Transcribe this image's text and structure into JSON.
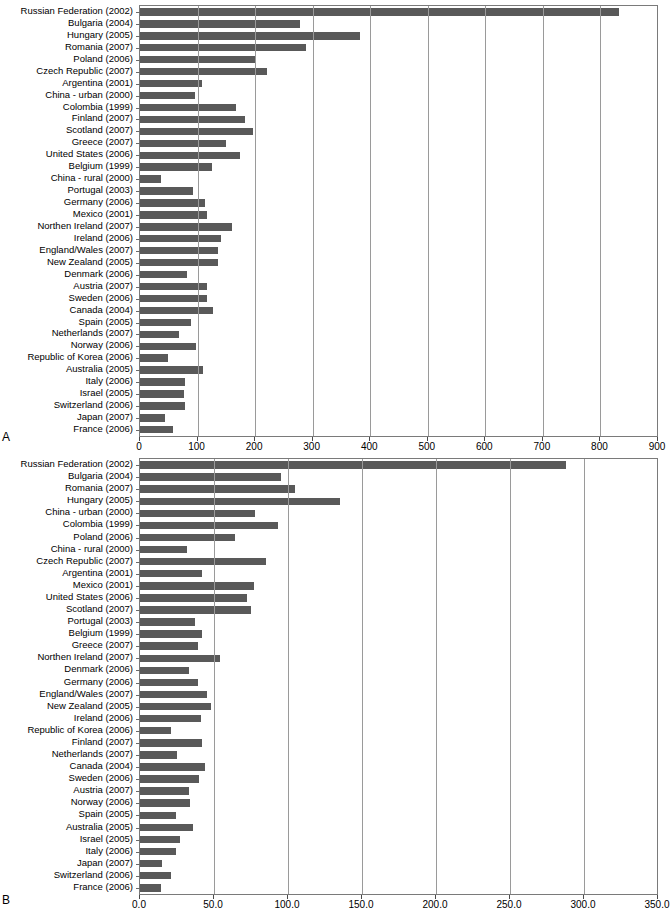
{
  "figure": {
    "panel_a_letter": "A",
    "panel_b_letter": "B",
    "bar_color": "#595959",
    "axis_color": "#7a7a7a",
    "gridline_color": "#9a9a9a",
    "background": "#ffffff"
  },
  "chart_data": [
    {
      "id": "panel-a",
      "type": "bar",
      "orientation": "horizontal",
      "title": "",
      "subtitle": "",
      "xlabel": "",
      "ylabel": "",
      "xlim": [
        0,
        900
      ],
      "xticks": [
        0,
        100,
        200,
        300,
        400,
        500,
        600,
        700,
        800,
        900
      ],
      "xtick_labels": [
        "0",
        "100",
        "200",
        "300",
        "400",
        "500",
        "600",
        "700",
        "800",
        "900"
      ],
      "grid": true,
      "grid_axis": "x",
      "legend": "none",
      "panel_label": "A",
      "categories": [
        "Russian Federation (2002)",
        "Bulgaria (2004)",
        "Hungary (2005)",
        "Romania (2007)",
        "Poland (2006)",
        "Czech Republic (2007)",
        "Argentina (2001)",
        "China - urban (2000)",
        "Colombia (1999)",
        "Finland (2007)",
        "Scotland (2007)",
        "Greece (2007)",
        "United States (2006)",
        "Belgium (1999)",
        "China - rural (2000)",
        "Portugal (2003)",
        "Germany (2006)",
        "Mexico (2001)",
        "Northen Ireland (2007)",
        "Ireland (2006)",
        "England/Wales (2007)",
        "New Zealand (2005)",
        "Denmark (2006)",
        "Austria (2007)",
        "Sweden (2006)",
        "Canada (2004)",
        "Spain (2005)",
        "Netherlands (2007)",
        "Norway (2006)",
        "Republic of Korea (2006)",
        "Australia (2005)",
        "Italy (2006)",
        "Israel (2005)",
        "Switzerland (2006)",
        "Japan (2007)",
        "France (2006)"
      ],
      "values": [
        832,
        278,
        383,
        288,
        199,
        221,
        107,
        96,
        167,
        182,
        196,
        150,
        173,
        125,
        37,
        92,
        113,
        116,
        160,
        140,
        136,
        136,
        81,
        117,
        117,
        127,
        89,
        68,
        97,
        49,
        110,
        78,
        76,
        79,
        44,
        57
      ]
    },
    {
      "id": "panel-b",
      "type": "bar",
      "orientation": "horizontal",
      "title": "",
      "subtitle": "",
      "xlabel": "",
      "ylabel": "",
      "xlim": [
        0,
        350
      ],
      "xticks": [
        0,
        50,
        100,
        150,
        200,
        250,
        300,
        350
      ],
      "xtick_labels": [
        "0.0",
        "50.0",
        "100.0",
        "150.0",
        "200.0",
        "250.0",
        "300.0",
        "350.0"
      ],
      "grid": true,
      "grid_axis": "x",
      "legend": "none",
      "panel_label": "B",
      "categories": [
        "Russian Federation (2002)",
        "Bulgaria (2004)",
        "Romania (2007)",
        "Hungary (2005)",
        "China - urban (2000)",
        "Colombia (1999)",
        "Poland (2006)",
        "China - rural (2000)",
        "Czech Republic (2007)",
        "Argentina (2001)",
        "Mexico (2001)",
        "United States (2006)",
        "Scotland (2007)",
        "Portugal (2003)",
        "Belgium (1999)",
        "Greece (2007)",
        "Northen Ireland (2007)",
        "Denmark (2006)",
        "Germany (2006)",
        "England/Wales (2007)",
        "New Zealand (2005)",
        "Ireland (2006)",
        "Republic of Korea (2006)",
        "Finland (2007)",
        "Netherlands (2007)",
        "Canada (2004)",
        "Sweden (2006)",
        "Austria (2007)",
        "Norway (2006)",
        "Spain (2005)",
        "Australia (2005)",
        "Israel (2005)",
        "Italy (2006)",
        "Japan (2007)",
        "Switzerland (2006)",
        "France (2006)"
      ],
      "values": [
        288.0,
        95.0,
        105.0,
        135.0,
        78.0,
        93.0,
        64.0,
        32.0,
        85.0,
        42.0,
        77.0,
        72.0,
        75.0,
        37.0,
        42.0,
        39.0,
        54.0,
        33.0,
        39.0,
        45.0,
        48.0,
        41.0,
        21.0,
        42.0,
        25.0,
        44.0,
        40.0,
        33.0,
        34.0,
        24.0,
        36.0,
        27.0,
        24.0,
        15.0,
        21.0,
        14.0
      ]
    }
  ]
}
